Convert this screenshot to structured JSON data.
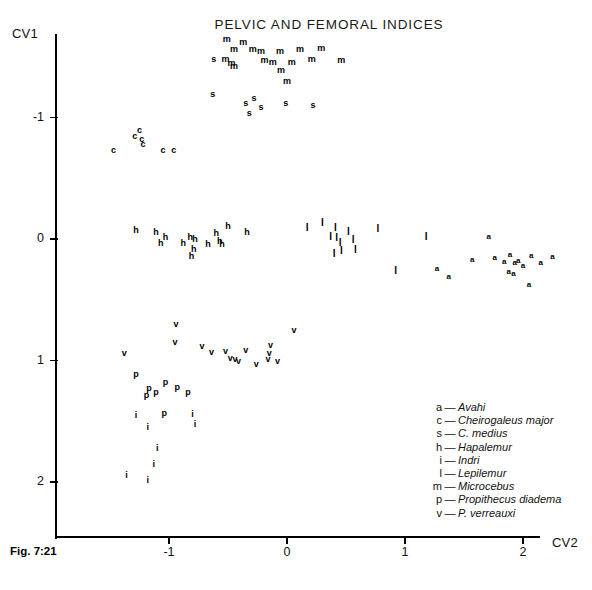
{
  "figure": {
    "caption": "Fig. 7:21",
    "title": "PELVIC AND FEMORAL INDICES"
  },
  "axes": {
    "x_label": "CV2",
    "y_label": "CV1",
    "x_ticks": [
      "-1",
      "0",
      "1",
      "2"
    ],
    "y_ticks": [
      "-1",
      "0",
      "1",
      "2"
    ]
  },
  "legend": {
    "dash": "—",
    "entries": [
      {
        "key": "a",
        "name": "Avahi"
      },
      {
        "key": "c",
        "name": "Cheirogaleus major"
      },
      {
        "key": "s",
        "name": "C. medius"
      },
      {
        "key": "h",
        "name": "Hapalemur"
      },
      {
        "key": "i",
        "name": "Indri"
      },
      {
        "key": "l",
        "name": "Lepilemur"
      },
      {
        "key": "m",
        "name": "Microcebus"
      },
      {
        "key": "p",
        "name": "Propithecus diadema"
      },
      {
        "key": "v",
        "name": "P. verreauxi"
      }
    ]
  },
  "chart_data": {
    "type": "scatter",
    "title": "PELVIC AND FEMORAL INDICES",
    "xlabel": "CV2",
    "ylabel": "CV1",
    "xlim": [
      -1.85,
      2.45
    ],
    "ylim": [
      -1.75,
      2.25
    ],
    "y_axis_inverted": true,
    "grid": false,
    "legend_position": "bottom-right",
    "xticks": [
      -1,
      0,
      1,
      2
    ],
    "yticks": [
      -1,
      0,
      1,
      2
    ],
    "series": [
      {
        "name": "Microcebus",
        "marker": "m",
        "points": [
          [
            -0.51,
            -1.65
          ],
          [
            -0.37,
            -1.62
          ],
          [
            -0.45,
            -1.56
          ],
          [
            -0.29,
            -1.56
          ],
          [
            -0.22,
            -1.55
          ],
          [
            -0.06,
            -1.55
          ],
          [
            0.11,
            -1.56
          ],
          [
            0.29,
            -1.57
          ],
          [
            -0.52,
            -1.48
          ],
          [
            -0.47,
            -1.45
          ],
          [
            -0.45,
            -1.42
          ],
          [
            -0.19,
            -1.47
          ],
          [
            -0.12,
            -1.46
          ],
          [
            0.04,
            -1.46
          ],
          [
            0.21,
            -1.48
          ],
          [
            0.46,
            -1.47
          ],
          [
            -0.05,
            -1.39
          ],
          [
            0.0,
            -1.3
          ]
        ]
      },
      {
        "name": "C. medius",
        "marker": "s",
        "points": [
          [
            -0.62,
            -1.48
          ],
          [
            -0.63,
            -1.19
          ],
          [
            -0.35,
            -1.12
          ],
          [
            -0.28,
            -1.16
          ],
          [
            -0.22,
            -1.09
          ],
          [
            -0.32,
            -1.04
          ],
          [
            -0.01,
            -1.12
          ],
          [
            0.22,
            -1.1
          ]
        ]
      },
      {
        "name": "Cheirogaleus major",
        "marker": "c",
        "points": [
          [
            -1.29,
            -0.85
          ],
          [
            -1.23,
            -0.82
          ],
          [
            -1.22,
            -0.78
          ],
          [
            -1.25,
            -0.9
          ],
          [
            -1.47,
            -0.73
          ],
          [
            -1.05,
            -0.73
          ],
          [
            -0.96,
            -0.73
          ]
        ]
      },
      {
        "name": "Hapalemur",
        "marker": "h",
        "points": [
          [
            -1.28,
            -0.07
          ],
          [
            -1.11,
            -0.06
          ],
          [
            -1.03,
            -0.02
          ],
          [
            -1.07,
            0.03
          ],
          [
            -0.88,
            0.03
          ],
          [
            -0.82,
            -0.02
          ],
          [
            -0.78,
            0.0
          ],
          [
            -0.79,
            0.08
          ],
          [
            -0.81,
            0.14
          ],
          [
            -0.67,
            0.04
          ],
          [
            -0.6,
            -0.05
          ],
          [
            -0.57,
            0.02
          ],
          [
            -0.55,
            0.04
          ],
          [
            -0.5,
            -0.11
          ],
          [
            -0.34,
            -0.06
          ]
        ]
      },
      {
        "name": "Lepilemur",
        "marker": "l",
        "points": [
          [
            0.17,
            -0.09
          ],
          [
            0.3,
            -0.13
          ],
          [
            0.37,
            -0.02
          ],
          [
            0.41,
            -0.09
          ],
          [
            0.42,
            -0.01
          ],
          [
            0.45,
            0.03
          ],
          [
            0.46,
            0.1
          ],
          [
            0.52,
            -0.06
          ],
          [
            0.56,
            0.01
          ],
          [
            0.58,
            0.09
          ],
          [
            0.4,
            0.12
          ],
          [
            0.77,
            -0.08
          ],
          [
            0.92,
            0.26
          ],
          [
            1.18,
            -0.02
          ]
        ]
      },
      {
        "name": "Avahi",
        "marker": "a",
        "points": [
          [
            1.27,
            0.25
          ],
          [
            1.37,
            0.31
          ],
          [
            1.57,
            0.17
          ],
          [
            1.71,
            -0.02
          ],
          [
            1.76,
            0.16
          ],
          [
            1.84,
            0.19
          ],
          [
            1.89,
            0.13
          ],
          [
            1.93,
            0.2
          ],
          [
            1.96,
            0.18
          ],
          [
            1.88,
            0.27
          ],
          [
            1.92,
            0.29
          ],
          [
            2.0,
            0.22
          ],
          [
            2.07,
            0.14
          ],
          [
            2.15,
            0.2
          ],
          [
            2.05,
            0.38
          ],
          [
            2.25,
            0.15
          ]
        ]
      },
      {
        "name": "P. verreauxi",
        "marker": "v",
        "points": [
          [
            -1.38,
            0.94
          ],
          [
            -0.94,
            0.7
          ],
          [
            -0.95,
            0.85
          ],
          [
            -0.72,
            0.88
          ],
          [
            -0.64,
            0.93
          ],
          [
            -0.52,
            0.92
          ],
          [
            -0.48,
            0.98
          ],
          [
            -0.44,
            0.99
          ],
          [
            -0.41,
            1.0
          ],
          [
            -0.35,
            0.91
          ],
          [
            -0.26,
            1.03
          ],
          [
            -0.14,
            0.87
          ],
          [
            -0.15,
            0.94
          ],
          [
            -0.16,
            0.99
          ],
          [
            -0.08,
            1.0
          ],
          [
            0.06,
            0.75
          ]
        ]
      },
      {
        "name": "Propithecus diadema",
        "marker": "p",
        "points": [
          [
            -1.28,
            1.11
          ],
          [
            -1.17,
            1.23
          ],
          [
            -1.19,
            1.28
          ],
          [
            -1.11,
            1.26
          ],
          [
            -1.03,
            1.18
          ],
          [
            -0.93,
            1.22
          ],
          [
            -1.04,
            1.43
          ],
          [
            -0.84,
            1.26
          ]
        ]
      },
      {
        "name": "Indri",
        "marker": "i",
        "points": [
          [
            -1.28,
            1.45
          ],
          [
            -1.18,
            1.55
          ],
          [
            -0.8,
            1.44
          ],
          [
            -0.78,
            1.52
          ],
          [
            -1.1,
            1.72
          ],
          [
            -1.36,
            1.94
          ],
          [
            -1.18,
            1.98
          ],
          [
            -1.13,
            1.85
          ]
        ]
      }
    ]
  }
}
